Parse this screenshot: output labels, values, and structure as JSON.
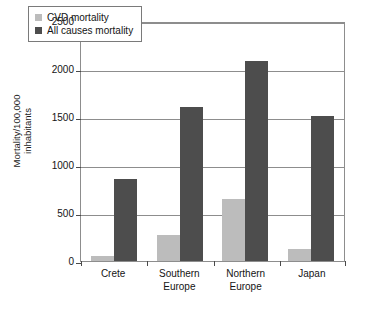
{
  "chart_data": {
    "type": "bar",
    "title": "",
    "xlabel": "",
    "ylabel": "Mortality/100,000 inhabitants",
    "ylabel_lines": [
      "Mortality/100,000",
      "inhabitants"
    ],
    "categories": [
      "Crete",
      "Southern Europe",
      "Northern Europe",
      "Japan"
    ],
    "category_lines": [
      [
        "Crete"
      ],
      [
        "Southern",
        "Europe"
      ],
      [
        "Northern",
        "Europe"
      ],
      [
        "Japan"
      ]
    ],
    "series": [
      {
        "name": "CVD mortality",
        "color": "#bcbcbc",
        "values": [
          50,
          270,
          650,
          130
        ]
      },
      {
        "name": "All causes mortality",
        "color": "#4d4d4d",
        "values": [
          850,
          1600,
          2080,
          1510
        ]
      }
    ],
    "ylim": [
      0,
      2500
    ],
    "yticks": [
      0,
      500,
      1000,
      1500,
      2000,
      2500
    ],
    "ytick_labels": [
      "0",
      "500",
      "1000",
      "1500",
      "2000",
      "2500"
    ],
    "grid": true,
    "legend_position": "top-left"
  },
  "legend": {
    "items": [
      {
        "label": "CVD mortality",
        "color": "#bcbcbc"
      },
      {
        "label": "All causes mortality",
        "color": "#4d4d4d"
      }
    ]
  }
}
